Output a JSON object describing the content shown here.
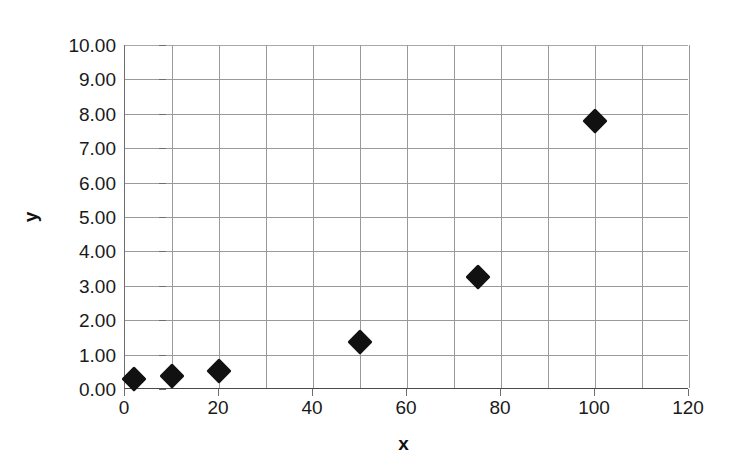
{
  "chart_data": {
    "type": "scatter",
    "title": "",
    "xlabel": "x",
    "ylabel": "y",
    "xlim": [
      0,
      120
    ],
    "ylim": [
      0,
      10
    ],
    "grid": true,
    "legend": "none",
    "marker": "black-diamond",
    "x_ticks": [
      "0",
      "20",
      "40",
      "60",
      "80",
      "100",
      "120"
    ],
    "x_tick_values": [
      0,
      20,
      40,
      60,
      80,
      100,
      120
    ],
    "x_minor_step": 10,
    "y_ticks": [
      "0.00",
      "1.00",
      "2.00",
      "3.00",
      "4.00",
      "5.00",
      "6.00",
      "7.00",
      "8.00",
      "9.00",
      "10.00"
    ],
    "y_tick_values": [
      0,
      1,
      2,
      3,
      4,
      5,
      6,
      7,
      8,
      9,
      10
    ],
    "series": [
      {
        "name": "series-1",
        "color": "#111111",
        "points": [
          {
            "x": 2,
            "y": 0.3
          },
          {
            "x": 10,
            "y": 0.38
          },
          {
            "x": 20,
            "y": 0.52
          },
          {
            "x": 50,
            "y": 1.38
          },
          {
            "x": 75,
            "y": 3.25
          },
          {
            "x": 100,
            "y": 7.8
          }
        ]
      }
    ]
  },
  "colors": {
    "marker": "#111111",
    "gridline": "#9a9a9a",
    "axis": "#4a4a4a",
    "text": "#1a1a1a",
    "background": "#ffffff"
  }
}
